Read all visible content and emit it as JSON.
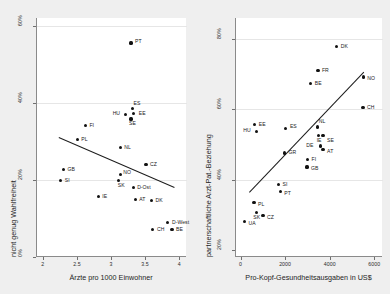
{
  "figure": {
    "background": "#efefef",
    "panel_background": "#ffffff",
    "point_color": "#111111",
    "line_color": "#1c1c1c"
  },
  "chart_data": [
    {
      "type": "scatter",
      "id": "left",
      "title": "",
      "xlabel": "Ärzte pro 1000 Einwohner",
      "ylabel": "nicht genug Wahlfreiheit",
      "xlim": [
        1.9,
        4.1
      ],
      "ylim": [
        0,
        62
      ],
      "xticks": [
        2,
        2.5,
        3,
        3.5,
        4
      ],
      "xticklabels": [
        "2",
        "2.5",
        "3",
        "3.5",
        "4"
      ],
      "yticks": [
        0,
        20,
        40,
        60
      ],
      "yticklabels": [
        "0%",
        "20%",
        "40%",
        "60%"
      ],
      "grid": true,
      "legend": "none",
      "points": [
        {
          "label": "PT",
          "x": 3.28,
          "y": 55.5,
          "lx": 4,
          "ly": -2
        },
        {
          "label": "ES",
          "x": 3.3,
          "y": 38.6,
          "lx": 1,
          "ly": -6
        },
        {
          "label": "EE",
          "x": 3.32,
          "y": 37.2,
          "lx": 5,
          "ly": -1
        },
        {
          "label": "HU",
          "x": 3.2,
          "y": 37.0,
          "lx": -13,
          "ly": -2
        },
        {
          "label": "SE",
          "x": 3.28,
          "y": 35.8,
          "lx": -2,
          "ly": 4
        },
        {
          "label": "FI",
          "x": 2.61,
          "y": 34.2,
          "lx": 4,
          "ly": -1
        },
        {
          "label": "PL",
          "x": 2.49,
          "y": 30.4,
          "lx": 4,
          "ly": -1
        },
        {
          "label": "NL",
          "x": 3.12,
          "y": 28.4,
          "lx": 4,
          "ly": -1
        },
        {
          "label": "CZ",
          "x": 3.5,
          "y": 24.0,
          "lx": 4,
          "ly": -1
        },
        {
          "label": "GB",
          "x": 2.29,
          "y": 22.8,
          "lx": 4,
          "ly": -1
        },
        {
          "label": "NO",
          "x": 3.12,
          "y": 21.4,
          "lx": 3,
          "ly": -3
        },
        {
          "label": "SK",
          "x": 3.1,
          "y": 19.8,
          "lx": -1,
          "ly": 4
        },
        {
          "label": "SI",
          "x": 2.25,
          "y": 19.8,
          "lx": 4,
          "ly": -1
        },
        {
          "label": "D-Ost",
          "x": 3.31,
          "y": 18.0,
          "lx": 4,
          "ly": -1
        },
        {
          "label": "IE",
          "x": 2.8,
          "y": 15.6,
          "lx": 4,
          "ly": -1
        },
        {
          "label": "AT",
          "x": 3.34,
          "y": 15.0,
          "lx": 4,
          "ly": -1
        },
        {
          "label": "DK",
          "x": 3.58,
          "y": 14.6,
          "lx": 4,
          "ly": -1
        },
        {
          "label": "D-West",
          "x": 3.82,
          "y": 9.0,
          "lx": 4,
          "ly": -1
        },
        {
          "label": "CH",
          "x": 3.6,
          "y": 7.2,
          "lx": 4,
          "ly": -1
        },
        {
          "label": "BE",
          "x": 3.88,
          "y": 7.2,
          "lx": 4,
          "ly": -1
        }
      ],
      "fit_line": {
        "x1": 2.22,
        "y1": 31.2,
        "x2": 3.92,
        "y2": 18.2
      }
    },
    {
      "type": "scatter",
      "id": "right",
      "title": "",
      "xlabel": "Pro-Kopf-Gesundheitsausgaben in US$",
      "ylabel": "partnerschaftliche Arzt-Pat.-Beziehung",
      "xlim": [
        -250,
        6350
      ],
      "ylim": [
        18,
        86
      ],
      "xticks": [
        0,
        2000,
        4000,
        6000
      ],
      "xticklabels": [
        "0",
        "2000",
        "4000",
        "6000"
      ],
      "yticks": [
        20,
        40,
        60,
        80
      ],
      "yticklabels": [
        "20%",
        "40%",
        "60%",
        "80%"
      ],
      "grid": true,
      "legend": "none",
      "points": [
        {
          "label": "DK",
          "x": 4270,
          "y": 78.0,
          "lx": 4,
          "ly": -1
        },
        {
          "label": "FR",
          "x": 3430,
          "y": 71.0,
          "lx": 4,
          "ly": -1
        },
        {
          "label": "NO",
          "x": 5460,
          "y": 69.2,
          "lx": 4,
          "ly": 1
        },
        {
          "label": "BE",
          "x": 3110,
          "y": 67.4,
          "lx": 4,
          "ly": -1
        },
        {
          "label": "CH",
          "x": 5450,
          "y": 60.6,
          "lx": 4,
          "ly": -1
        },
        {
          "label": "EE",
          "x": 590,
          "y": 55.6,
          "lx": 4,
          "ly": -1
        },
        {
          "label": "ES",
          "x": 1990,
          "y": 54.6,
          "lx": 4,
          "ly": -3
        },
        {
          "label": "NL",
          "x": 3420,
          "y": 55.0,
          "lx": 1,
          "ly": -6
        },
        {
          "label": "HU",
          "x": 660,
          "y": 53.6,
          "lx": -13,
          "ly": -2
        },
        {
          "label": "IE",
          "x": 3460,
          "y": 52.6,
          "lx": -2,
          "ly": 4
        },
        {
          "label": "SE",
          "x": 3660,
          "y": 52.6,
          "lx": 0,
          "ly": 4
        },
        {
          "label": "DE",
          "x": 3530,
          "y": 49.6,
          "lx": -14,
          "ly": 0
        },
        {
          "label": "AT",
          "x": 3660,
          "y": 48.6,
          "lx": 4,
          "ly": 1
        },
        {
          "label": "GR",
          "x": 1930,
          "y": 47.6,
          "lx": 4,
          "ly": -1
        },
        {
          "label": "FI",
          "x": 2960,
          "y": 45.8,
          "lx": 4,
          "ly": -1
        },
        {
          "label": "GB",
          "x": 2940,
          "y": 43.6,
          "lx": 4,
          "ly": 1
        },
        {
          "label": "SI",
          "x": 1660,
          "y": 38.6,
          "lx": 4,
          "ly": -1
        },
        {
          "label": "PT",
          "x": 1740,
          "y": 36.6,
          "lx": 4,
          "ly": 1
        },
        {
          "label": "PL",
          "x": 560,
          "y": 33.4,
          "lx": 4,
          "ly": 1
        },
        {
          "label": "SK",
          "x": 660,
          "y": 30.6,
          "lx": -3,
          "ly": 4
        },
        {
          "label": "CZ",
          "x": 960,
          "y": 29.8,
          "lx": 4,
          "ly": 1
        },
        {
          "label": "UA",
          "x": 130,
          "y": 28.2,
          "lx": 4,
          "ly": 1
        }
      ],
      "fit_line": {
        "x1": 330,
        "y1": 36.4,
        "x2": 5470,
        "y2": 70.6
      }
    }
  ]
}
